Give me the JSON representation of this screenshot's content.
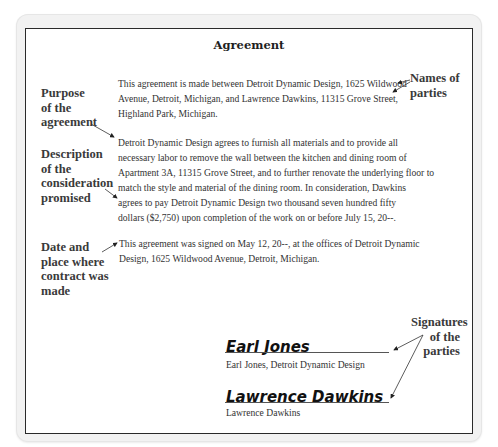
{
  "document": {
    "title": "Agreement",
    "paragraphs": [
      "This agreement is made between Detroit Dynamic Design, 1625 Wildwood\nAvenue, Detroit, Michigan, and Lawrence Dawkins, 11315 Grove Street,\nHighland Park, Michigan.",
      "Detroit Dynamic Design agrees to furnish all materials and to provide all\nnecessary labor to remove the wall between the kitchen and dining room of\nApartment 3A, 11315 Grove Street, and to further renovate the underlying floor to\nmatch the style and material of the dining room.  In consideration, Dawkins\nagrees to pay Detroit Dynamic Design two thousand seven hundred fifty\ndollars ($2,750) upon completion of the work on or before July 15, 20--.",
      "This agreement was signed on May 12, 20--, at the offices of Detroit Dynamic\nDesign, 1625 Wildwood Avenue, Detroit, Michigan."
    ],
    "signatures": [
      {
        "signature": "Earl Jones",
        "caption": "Earl Jones, Detroit Dynamic Design"
      },
      {
        "signature": "Lawrence Dawkins",
        "caption": "Lawrence Dawkins"
      }
    ]
  },
  "annotations": {
    "purpose": "Purpose\nof the\nagreement",
    "names": "Names  of\n   parties",
    "consideration": "Description\nof the\nconsideration\npromised",
    "date_place": "Date and\nplace where\ncontract was\nmade",
    "signatures": "Signatures\nof the\nparties"
  }
}
